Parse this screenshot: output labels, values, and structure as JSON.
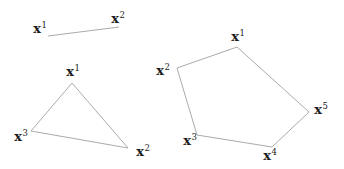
{
  "figure": {
    "background": "#ffffff",
    "line_color": "#a0a0a0",
    "label_color": "#1c1c1c",
    "shapes": [
      {
        "name": "line-segment",
        "closed": false,
        "vertices": [
          [
            48,
            36
          ],
          [
            119,
            27
          ]
        ],
        "labels": [
          {
            "base": "x",
            "sup": "1",
            "x": 40,
            "y": 28
          },
          {
            "base": "x",
            "sup": "2",
            "x": 118,
            "y": 18
          }
        ]
      },
      {
        "name": "triangle",
        "closed": true,
        "vertices": [
          [
            72,
            83
          ],
          [
            128,
            148
          ],
          [
            31,
            131
          ]
        ],
        "labels": [
          {
            "base": "x",
            "sup": "1",
            "x": 73,
            "y": 71
          },
          {
            "base": "x",
            "sup": "2",
            "x": 143,
            "y": 151
          },
          {
            "base": "x",
            "sup": "3",
            "x": 21,
            "y": 136
          }
        ]
      },
      {
        "name": "pentagon",
        "closed": true,
        "vertices": [
          [
            237,
            47
          ],
          [
            309,
            112
          ],
          [
            272,
            147
          ],
          [
            197,
            135
          ],
          [
            177,
            68
          ]
        ],
        "labels": [
          {
            "base": "x",
            "sup": "1",
            "x": 238,
            "y": 36
          },
          {
            "base": "x",
            "sup": "2",
            "x": 163,
            "y": 70
          },
          {
            "base": "x",
            "sup": "3",
            "x": 190,
            "y": 140
          },
          {
            "base": "x",
            "sup": "4",
            "x": 270,
            "y": 155
          },
          {
            "base": "x",
            "sup": "5",
            "x": 321,
            "y": 109
          }
        ]
      }
    ]
  }
}
